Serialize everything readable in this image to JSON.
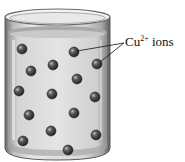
{
  "diagram": {
    "label": {
      "species": "Cu",
      "charge": "2+",
      "word": "ions"
    },
    "ions": [
      {
        "x": 22,
        "y": 49
      },
      {
        "x": 74,
        "y": 52
      },
      {
        "x": 53,
        "y": 65
      },
      {
        "x": 31,
        "y": 71
      },
      {
        "x": 97,
        "y": 64
      },
      {
        "x": 77,
        "y": 79
      },
      {
        "x": 19,
        "y": 91
      },
      {
        "x": 52,
        "y": 94
      },
      {
        "x": 95,
        "y": 97
      },
      {
        "x": 29,
        "y": 115
      },
      {
        "x": 74,
        "y": 113
      },
      {
        "x": 51,
        "y": 131
      },
      {
        "x": 23,
        "y": 141
      },
      {
        "x": 96,
        "y": 135
      },
      {
        "x": 68,
        "y": 150
      }
    ],
    "colors": {
      "glass": "#8a8a8a",
      "liquid": "#dcdcdc",
      "ion": "#3a3a3a"
    }
  }
}
